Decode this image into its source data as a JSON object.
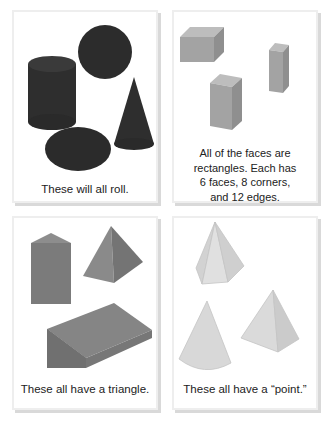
{
  "panels": [
    {
      "id": "roll",
      "caption": "These will all roll.",
      "shapes": [
        "cylinder",
        "sphere",
        "cone",
        "ellipsoid"
      ],
      "color": "#2b2b2b"
    },
    {
      "id": "rectangles",
      "caption_lines": [
        "All of the faces are",
        "rectangles. Each has",
        "6 faces, 8 corners,",
        "and 12 edges."
      ],
      "shapes": [
        "rectangular-prism-wide",
        "rectangular-prism-tall",
        "rectangular-prism-narrow"
      ],
      "color": "#a0a0a0"
    },
    {
      "id": "triangle",
      "caption": "These all have a triangle.",
      "shapes": [
        "triangular-prism",
        "square-pyramid",
        "wedge"
      ],
      "color": "#7a7a7a"
    },
    {
      "id": "point",
      "caption": "These all have a “point.”",
      "shapes": [
        "hexagonal-pyramid",
        "cone-sector",
        "triangular-pyramid"
      ],
      "color": "#d6d6d6"
    }
  ]
}
